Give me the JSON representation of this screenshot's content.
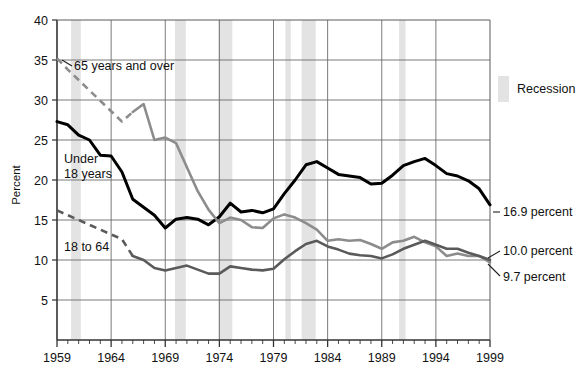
{
  "chart_data": {
    "type": "line",
    "title": "",
    "xlabel": "",
    "ylabel": "Percent",
    "xlim": [
      1959,
      1999
    ],
    "ylim": [
      0,
      40
    ],
    "ytick_start": 5,
    "ytick_step": 5,
    "xtick_step": 5,
    "grid": true,
    "legend_position": "right-top",
    "x": [
      1959,
      1960,
      1961,
      1962,
      1963,
      1964,
      1965,
      1966,
      1967,
      1968,
      1969,
      1970,
      1971,
      1972,
      1973,
      1974,
      1975,
      1976,
      1977,
      1978,
      1979,
      1980,
      1981,
      1982,
      1983,
      1984,
      1985,
      1986,
      1987,
      1988,
      1989,
      1990,
      1991,
      1992,
      1993,
      1994,
      1995,
      1996,
      1997,
      1998,
      1999
    ],
    "yticks": [
      5,
      10,
      15,
      20,
      25,
      30,
      35,
      40
    ],
    "xticks": [
      1959,
      1964,
      1969,
      1974,
      1979,
      1984,
      1989,
      1994,
      1999
    ],
    "series": [
      {
        "name": "Under 18 years",
        "color": "#000000",
        "label_text": "Under\n18 years",
        "end_label": "16.9 percent",
        "end_value": 16.9,
        "dashed_until": null,
        "values": [
          27.3,
          26.9,
          25.6,
          25.0,
          23.1,
          23.0,
          21.0,
          17.6,
          16.6,
          15.6,
          14.0,
          15.1,
          15.3,
          15.1,
          14.4,
          15.4,
          17.1,
          16.0,
          16.2,
          15.9,
          16.4,
          18.3,
          20.0,
          21.9,
          22.3,
          21.5,
          20.7,
          20.5,
          20.3,
          19.5,
          19.6,
          20.6,
          21.8,
          22.3,
          22.7,
          21.8,
          20.8,
          20.5,
          19.9,
          18.9,
          16.9
        ]
      },
      {
        "name": "65 years and over",
        "color": "#8c8c8c",
        "label_text": "65 years and over",
        "end_label": "9.7 percent",
        "end_value": 9.7,
        "dashed_from": 1959,
        "dashed_to": 1966,
        "values": [
          35.2,
          33.8,
          32.5,
          31.2,
          29.9,
          28.6,
          27.3,
          28.5,
          29.5,
          25.0,
          25.3,
          24.6,
          21.6,
          18.6,
          16.3,
          14.6,
          15.3,
          15.0,
          14.1,
          14.0,
          15.2,
          15.7,
          15.3,
          14.6,
          13.8,
          12.4,
          12.6,
          12.4,
          12.5,
          12.0,
          11.4,
          12.2,
          12.4,
          12.9,
          12.2,
          11.7,
          10.5,
          10.8,
          10.5,
          10.5,
          9.7
        ]
      },
      {
        "name": "18 to 64",
        "color": "#5a5a5a",
        "label_text": "18 to 64",
        "end_label": "10.0 percent",
        "end_value": 10.0,
        "dashed_from": 1959,
        "dashed_to": 1966,
        "values": [
          16.2,
          15.6,
          15.0,
          14.4,
          13.8,
          13.2,
          12.6,
          10.5,
          10.0,
          9.0,
          8.7,
          9.0,
          9.3,
          8.8,
          8.3,
          8.3,
          9.2,
          9.0,
          8.8,
          8.7,
          8.9,
          10.1,
          11.1,
          12.0,
          12.4,
          11.7,
          11.3,
          10.8,
          10.6,
          10.5,
          10.2,
          10.7,
          11.4,
          11.9,
          12.4,
          11.9,
          11.4,
          11.4,
          10.9,
          10.5,
          10.0
        ]
      }
    ],
    "recessions": [
      {
        "start": 1960.3,
        "end": 1961.2
      },
      {
        "start": 1969.9,
        "end": 1970.9
      },
      {
        "start": 1973.9,
        "end": 1975.2
      },
      {
        "start": 1980.1,
        "end": 1980.6
      },
      {
        "start": 1981.6,
        "end": 1982.9
      },
      {
        "start": 1990.6,
        "end": 1991.2
      }
    ],
    "recession_color": "#e3e3e3",
    "legend": [
      {
        "label": "Recession",
        "type": "swatch",
        "color": "#e3e3e3"
      }
    ]
  }
}
